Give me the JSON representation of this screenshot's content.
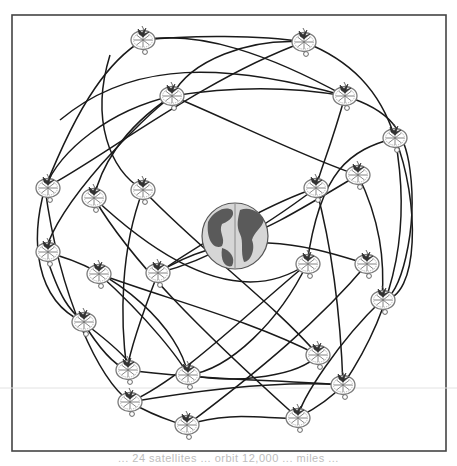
{
  "figure": {
    "frame": {
      "x": 12,
      "y": 15,
      "width": 434,
      "height": 436,
      "stroke": "#444444"
    },
    "scan_line_y": 388,
    "globe": {
      "cx": 235,
      "cy": 236,
      "r": 33,
      "ocean": "#d6d6d6",
      "land": "#5a5a5a",
      "label": "Earth"
    },
    "orbit_color": "#1a1a1a",
    "satellite_count": 30,
    "satellites": [
      {
        "x": 143,
        "y": 40
      },
      {
        "x": 304,
        "y": 42
      },
      {
        "x": 172,
        "y": 96
      },
      {
        "x": 345,
        "y": 96
      },
      {
        "x": 395,
        "y": 138
      },
      {
        "x": 358,
        "y": 175
      },
      {
        "x": 45,
        "y": 188
      },
      {
        "x": 94,
        "y": 198
      },
      {
        "x": 143,
        "y": 190
      },
      {
        "x": 316,
        "y": 188
      },
      {
        "x": 45,
        "y": 252
      },
      {
        "x": 99,
        "y": 274
      },
      {
        "x": 158,
        "y": 273
      },
      {
        "x": 307,
        "y": 264
      },
      {
        "x": 367,
        "y": 264
      },
      {
        "x": 382,
        "y": 300
      },
      {
        "x": 83,
        "y": 322
      },
      {
        "x": 318,
        "y": 355
      },
      {
        "x": 127,
        "y": 370
      },
      {
        "x": 188,
        "y": 375
      },
      {
        "x": 343,
        "y": 385
      },
      {
        "x": 130,
        "y": 402
      },
      {
        "x": 187,
        "y": 425
      },
      {
        "x": 298,
        "y": 418
      }
    ]
  },
  "caption": {
    "text": "... 24 satellites ... orbit 12,000 ... miles ..."
  }
}
